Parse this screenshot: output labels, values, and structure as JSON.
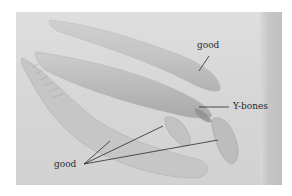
{
  "image": {
    "description": "Photograph of fish fillets on a cutting board with annotations",
    "labels": {
      "good_top": "good",
      "ybones": "Y-bones",
      "good_bottom": "good"
    },
    "colors": {
      "background": "#ffffff",
      "board": "#d8d8d8",
      "fillet": "#c8c8c8",
      "fillet_shadow": "#a8a8a8",
      "annotation_line": "#2a2a2a",
      "label_text": "#2a2a2a"
    }
  }
}
